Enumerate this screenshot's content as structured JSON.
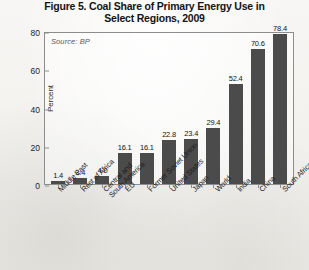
{
  "chart_data": {
    "type": "bar",
    "title": "Figure 5. Coal Share of Primary Energy Use in Select Regions, 2009",
    "title_line1": "Figure 5. Coal Share of Primary Energy Use in",
    "title_line2": "Select Regions, 2009",
    "source_note": "Source: BP",
    "xlabel": "",
    "ylabel": "Percent",
    "ylim": [
      0,
      80
    ],
    "yticks": [
      0,
      20,
      40,
      60,
      80
    ],
    "grid": false,
    "legend": "none",
    "bar_color": "#4b4b4b",
    "axis_color": "#8d8d8d",
    "categories": [
      "Middle East",
      "Rest of Africa",
      "Central and South America",
      "EU",
      "Former Soviet Union",
      "United States",
      "Japan",
      "World",
      "India",
      "China",
      "South Africa"
    ],
    "category_lines": [
      [
        "Middle East"
      ],
      [
        "Rest of Africa"
      ],
      [
        "Central and",
        "South America"
      ],
      [
        "EU"
      ],
      [
        "Former Soviet Union"
      ],
      [
        "United States"
      ],
      [
        "Japan"
      ],
      [
        "World"
      ],
      [
        "India"
      ],
      [
        "China"
      ],
      [
        "South Africa"
      ]
    ],
    "values": [
      1.4,
      3.4,
      4.0,
      16.1,
      16.1,
      22.8,
      23.4,
      29.4,
      52.4,
      70.6,
      78.4
    ],
    "value_labels": [
      "1.4",
      "3.4",
      "4.0",
      "16.1",
      "16.1",
      "22.8",
      "23.4",
      "29.4",
      "52.4",
      "70.6",
      "78.4"
    ]
  }
}
